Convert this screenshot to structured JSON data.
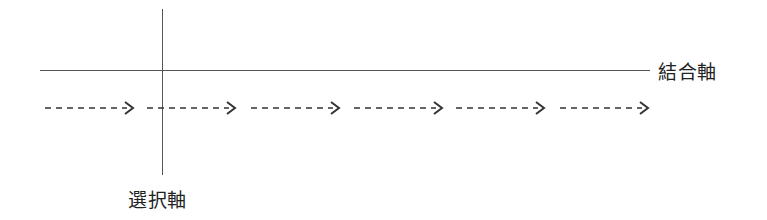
{
  "diagram": {
    "type": "axis-diagram",
    "horizontal_axis": {
      "label": "結合軸"
    },
    "vertical_axis": {
      "label": "選択軸"
    },
    "arrows": [
      {
        "id": 1,
        "x": 45
      },
      {
        "id": 2,
        "x": 147
      },
      {
        "id": 3,
        "x": 251
      },
      {
        "id": 4,
        "x": 354
      },
      {
        "id": 5,
        "x": 456
      },
      {
        "id": 6,
        "x": 560
      }
    ],
    "colors": {
      "line": "#555555",
      "text": "#222222",
      "arrow": "#333333"
    }
  }
}
